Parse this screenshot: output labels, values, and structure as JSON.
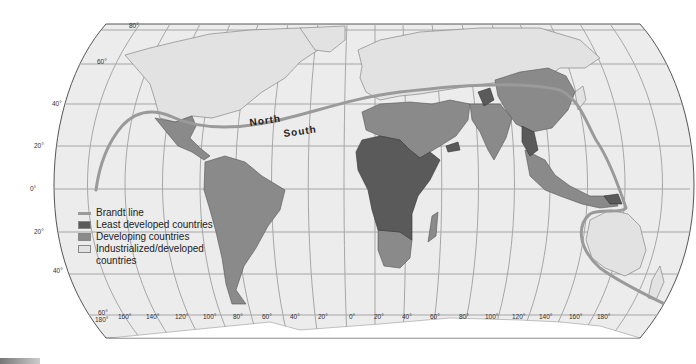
{
  "map": {
    "title": "",
    "projection": "Robinson",
    "labels": {
      "north": "North",
      "south": "South"
    },
    "latitude_labels": [
      {
        "text": "80°",
        "x": 135,
        "y": 30
      },
      {
        "text": "60°",
        "x": 100,
        "y": 64
      },
      {
        "text": "40°",
        "x": 56,
        "y": 104
      },
      {
        "text": "20°",
        "x": 36,
        "y": 146
      },
      {
        "text": "0°",
        "x": 30,
        "y": 189
      },
      {
        "text": "20°",
        "x": 36,
        "y": 232
      },
      {
        "text": "40°",
        "x": 56,
        "y": 274
      },
      {
        "text": "60°",
        "x": 99,
        "y": 315
      }
    ],
    "longitude_labels": [
      {
        "text": "180°",
        "x": 99,
        "y": 324
      },
      {
        "text": "160°",
        "x": 127,
        "y": 319
      },
      {
        "text": "140°",
        "x": 155,
        "y": 319
      },
      {
        "text": "120°",
        "x": 183,
        "y": 319
      },
      {
        "text": "100°",
        "x": 210,
        "y": 319
      },
      {
        "text": "80°",
        "x": 238,
        "y": 319
      },
      {
        "text": "60°",
        "x": 266,
        "y": 319
      },
      {
        "text": "40°",
        "x": 294,
        "y": 319
      },
      {
        "text": "20°",
        "x": 320,
        "y": 319
      },
      {
        "text": "0°",
        "x": 350,
        "y": 319
      },
      {
        "text": "20°",
        "x": 378,
        "y": 319
      },
      {
        "text": "40°",
        "x": 404,
        "y": 319
      },
      {
        "text": "60°",
        "x": 432,
        "y": 319
      },
      {
        "text": "80°",
        "x": 460,
        "y": 319
      },
      {
        "text": "100°",
        "x": 487,
        "y": 319
      },
      {
        "text": "120°",
        "x": 514,
        "y": 319
      },
      {
        "text": "140°",
        "x": 541,
        "y": 319
      },
      {
        "text": "160°",
        "x": 570,
        "y": 319
      },
      {
        "text": "180°",
        "x": 597,
        "y": 319
      }
    ]
  },
  "legend": {
    "items": [
      {
        "label": "Brandt line",
        "type": "line",
        "color": "#9a9a9a"
      },
      {
        "label": "Least developed countries",
        "type": "fill",
        "color": "#5a5a5a"
      },
      {
        "label": "Developing countries",
        "type": "fill",
        "color": "#8a8a8a"
      },
      {
        "label": "Industrialized/developed",
        "label2": "countries",
        "type": "fill",
        "color": "#e2e2e2"
      }
    ]
  },
  "colors": {
    "ocean": "#ececec",
    "graticule": "#9c9c9c",
    "industrialized": "#e2e2e2",
    "developing": "#8a8a8a",
    "least_developed": "#5a5a5a",
    "brandt_line": "#9a9a9a",
    "border": "#555555"
  }
}
